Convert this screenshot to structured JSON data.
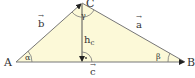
{
  "vertices": {
    "A": "A",
    "B": "B",
    "C": "C"
  },
  "sides": {
    "a": "a",
    "b": "b",
    "c": "c"
  },
  "angles": {
    "alpha": "α",
    "beta": "β",
    "gamma": "γ"
  },
  "altitude": {
    "label": "h",
    "subscript": "c"
  },
  "right_angle_dot": "·",
  "colors": {
    "fill": "#fcf9d8",
    "stroke": "#666666",
    "text": "#333333"
  }
}
